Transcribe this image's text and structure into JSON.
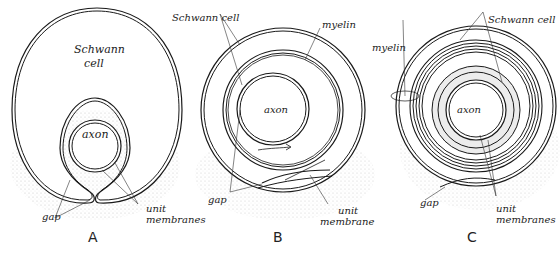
{
  "diagram": {
    "panels": [
      {
        "id": "A",
        "label": "A",
        "labels": {
          "schwann_line1": "Schwann",
          "schwann_line2": "cell",
          "axon": "axon",
          "gap": "gap",
          "unit_line1": "unit",
          "unit_line2": "membranes"
        }
      },
      {
        "id": "B",
        "label": "B",
        "labels": {
          "schwann": "Schwann cell",
          "myelin": "myelin",
          "axon": "axon",
          "gap": "gap",
          "unit_line1": "unit",
          "unit_line2": "membrane"
        }
      },
      {
        "id": "C",
        "label": "C",
        "labels": {
          "schwann": "Schwann cell",
          "myelin": "myelin",
          "axon": "axon",
          "gap": "gap",
          "unit_line1": "unit",
          "unit_line2": "membranes"
        }
      }
    ],
    "colors": {
      "line": "#1a1a1a",
      "stipple": "#c8c8c8",
      "background": "#ffffff"
    }
  }
}
